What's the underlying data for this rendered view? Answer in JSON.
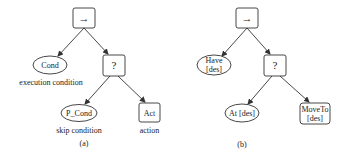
{
  "diagram_a": {
    "caption": "(a)",
    "root": {
      "symbol": "→",
      "type": "sequence"
    },
    "cond": {
      "label": "Cond",
      "annotation": "execution condition"
    },
    "fallback": {
      "symbol": "?",
      "type": "fallback"
    },
    "p_cond": {
      "label": "P_Cond",
      "annotation": "skip condition"
    },
    "act": {
      "label": "Act",
      "annotation": "action"
    }
  },
  "diagram_b": {
    "caption": "(b)",
    "root": {
      "symbol": "→",
      "type": "sequence"
    },
    "have": {
      "line1": "Have",
      "line2": "[des]"
    },
    "fallback": {
      "symbol": "?",
      "type": "fallback"
    },
    "at": {
      "label": "At [des]"
    },
    "moveto": {
      "line1": "MoveTo",
      "line2": "[des]"
    }
  },
  "colors": {
    "stroke": "#333333",
    "text": "#222222",
    "background": "#ffffff"
  }
}
